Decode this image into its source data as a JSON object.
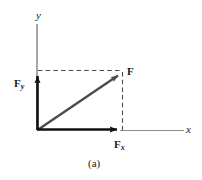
{
  "figure": {
    "caption": "(a)",
    "background_color": "#ffffff",
    "axes": {
      "y_label": "y",
      "x_label": "x",
      "axis_color": "#8c8c8c",
      "active_axis_color": "#1a1a1a"
    },
    "vectors": [
      {
        "name": "resultant",
        "label": "F",
        "subscript": "",
        "color": "#4a4a4a",
        "from": [
          37,
          130
        ],
        "to": [
          120,
          74
        ]
      },
      {
        "name": "y-component",
        "label": "F",
        "subscript": "y",
        "color": "#111111",
        "from": [
          37,
          130
        ],
        "to": [
          37,
          74
        ]
      },
      {
        "name": "x-component",
        "label": "F",
        "subscript": "x",
        "color": "#111111",
        "from": [
          37,
          130
        ],
        "to": [
          120,
          130
        ]
      }
    ],
    "projection_lines": {
      "style": "dashed",
      "color": "#4a4a4a",
      "horizontal": {
        "from": [
          37,
          71
        ],
        "to": [
          120,
          71
        ]
      },
      "vertical": {
        "from": [
          123,
          74
        ],
        "to": [
          123,
          130
        ]
      }
    },
    "origin": [
      37,
      130
    ]
  }
}
